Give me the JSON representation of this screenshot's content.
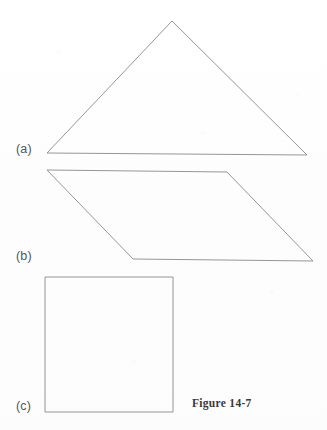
{
  "figure": {
    "caption": "Figure 14-7",
    "background_color": "#fefefe",
    "stroke_color": "#8a8a8a",
    "label_color": "#555555",
    "caption_color": "#3a3a3a",
    "canvas": {
      "width": 327,
      "height": 430
    },
    "parts": [
      {
        "label": "(a)",
        "shape_name": "triangle",
        "points": "172,21 307,155 47,153 172,21"
      },
      {
        "label": "(b)",
        "shape_name": "parallelogram",
        "points": "47,170 227,172 313,261 133,259 47,170"
      },
      {
        "label": "(c)",
        "shape_name": "square",
        "points": "45,277 173,277 173,412 45,412 45,277"
      }
    ]
  }
}
